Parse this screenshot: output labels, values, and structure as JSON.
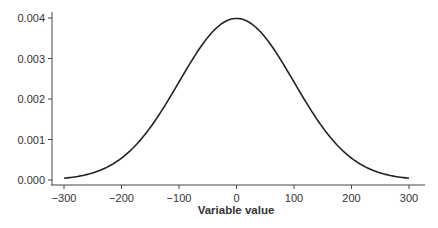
{
  "chart_data": {
    "type": "line",
    "title": "",
    "xlabel": "Variable value",
    "ylabel": "",
    "xlim": [
      -310,
      320
    ],
    "ylim": [
      0,
      0.0041
    ],
    "grid": false,
    "legend": null,
    "x_ticks": [
      -300,
      -200,
      -100,
      0,
      100,
      200,
      300
    ],
    "x_tick_labels": [
      "−300",
      "−200",
      "−100",
      "0",
      "100",
      "200",
      "300"
    ],
    "y_ticks": [
      0.0,
      0.001,
      0.002,
      0.003,
      0.004
    ],
    "y_tick_labels": [
      "0.000",
      "0.001",
      "0.002",
      "0.003",
      "0.004"
    ],
    "series": [
      {
        "name": "Normal density (mean 0, sd 100)",
        "color": "#222222",
        "x": [
          -300,
          -250,
          -200,
          -150,
          -100,
          -50,
          0,
          50,
          100,
          150,
          200,
          250,
          300
        ],
        "y": [
          4.43e-05,
          0.0001753,
          0.0005399,
          0.0012952,
          0.0024197,
          0.0035207,
          0.0039894,
          0.0035207,
          0.0024197,
          0.0012952,
          0.0005399,
          0.0001753,
          4.43e-05
        ]
      }
    ],
    "distribution": {
      "mean": 0,
      "sd": 100,
      "x_range": [
        -300,
        300
      ]
    }
  }
}
